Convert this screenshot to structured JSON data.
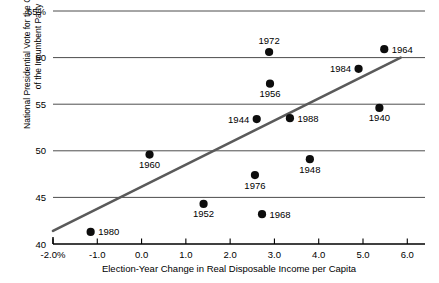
{
  "chart_data": {
    "type": "scatter",
    "title": "",
    "xlabel": "Election-Year Change in Real Disposable Income per Capita",
    "ylabel": "National Presidential Vote for the Candidate of the Incumbent Party",
    "ylabel_line1": "National Presidential Vote for the Candidate",
    "ylabel_line2": "of the Incumbent Party",
    "xlim": [
      -2.0,
      6.4
    ],
    "ylim": [
      40,
      65
    ],
    "xticks": [
      "-2.0%",
      "-1.0",
      "0.0",
      "1.0",
      "2.0",
      "3.0",
      "4.0",
      "5.0",
      "6.0"
    ],
    "xtick_values": [
      -2.0,
      -1.0,
      0.0,
      1.0,
      2.0,
      3.0,
      4.0,
      5.0,
      6.0
    ],
    "yticks": [
      "40",
      "45",
      "50",
      "55",
      "60",
      "65%"
    ],
    "ytick_values": [
      40,
      45,
      50,
      55,
      60,
      65
    ],
    "grid": "horizontal",
    "legend": "none",
    "series": [
      {
        "name": "Elections",
        "points": [
          {
            "label": "1980",
            "x": -1.15,
            "y": 41.3,
            "label_pos": "right"
          },
          {
            "label": "1960",
            "x": 0.18,
            "y": 49.6,
            "label_pos": "below"
          },
          {
            "label": "1952",
            "x": 1.4,
            "y": 44.3,
            "label_pos": "below"
          },
          {
            "label": "1968",
            "x": 2.72,
            "y": 43.2,
            "label_pos": "right"
          },
          {
            "label": "1976",
            "x": 2.56,
            "y": 47.4,
            "label_pos": "below"
          },
          {
            "label": "1944",
            "x": 2.6,
            "y": 53.4,
            "label_pos": "left"
          },
          {
            "label": "1988",
            "x": 3.35,
            "y": 53.5,
            "label_pos": "right"
          },
          {
            "label": "1948",
            "x": 3.8,
            "y": 49.1,
            "label_pos": "below"
          },
          {
            "label": "1956",
            "x": 2.9,
            "y": 57.2,
            "label_pos": "below"
          },
          {
            "label": "1972",
            "x": 2.88,
            "y": 60.6,
            "label_pos": "above"
          },
          {
            "label": "1984",
            "x": 4.9,
            "y": 58.8,
            "label_pos": "left"
          },
          {
            "label": "1964",
            "x": 5.48,
            "y": 60.9,
            "label_pos": "right"
          },
          {
            "label": "1940",
            "x": 5.37,
            "y": 54.6,
            "label_pos": "below"
          }
        ]
      }
    ],
    "fit_line": {
      "name": "regression-line",
      "x_start": -2.0,
      "y_start": 41.4,
      "x_end": 5.85,
      "y_end": 60.0,
      "color": "#5a5a5a"
    },
    "colors": {
      "dot": "#0d0d0d",
      "grid": "#4d4d4d",
      "axis": "#000000",
      "fit": "#5a5a5a",
      "background": "#ffffff"
    }
  }
}
